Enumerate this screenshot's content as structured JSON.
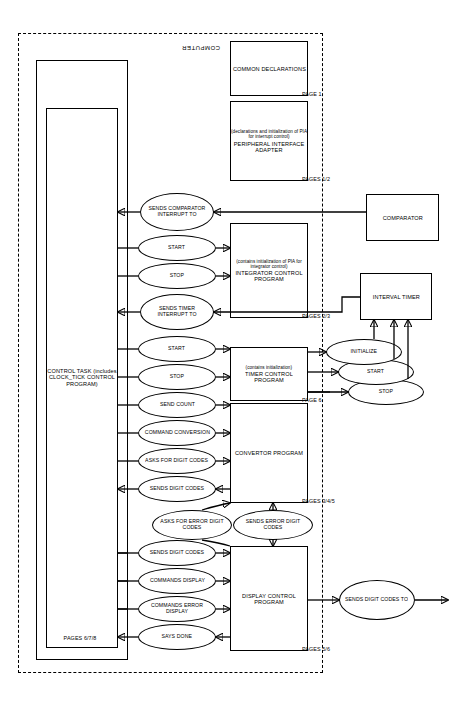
{
  "figure": {
    "orientation": "rotated-180",
    "boundary": {
      "label": "COMPUTER"
    }
  },
  "external_blocks": [
    {
      "name": "comparator",
      "label": "COMPARATOR"
    },
    {
      "name": "interval-timer",
      "label": "INTERVAL TIMER"
    }
  ],
  "control_program": {
    "outer_label": "CONTROL PROGRAM",
    "inner_label": "CONTROL TASK (includes CLOCK_TICK CONTROL PROGRAM)",
    "inner_pages": "PAGES 6/7/8"
  },
  "modules": [
    {
      "name": "display-control-program",
      "title": "DISPLAY CONTROL PROGRAM",
      "sub": "",
      "pages": "PAGES 5/6"
    },
    {
      "name": "convertor-program",
      "title": "CONVERTOR PROGRAM",
      "sub": "",
      "pages": "PAGES 3/4/5"
    },
    {
      "name": "timer-control-program",
      "title": "TIMER CONTROL PROGRAM",
      "sub": "(contains initialization)",
      "pages": "PAGE 6"
    },
    {
      "name": "integrator-control-program",
      "title": "INTEGRATOR CONTROL PROGRAM",
      "sub": "(contains initialization of PIA for integrator control)",
      "pages": "PAGES 2/3"
    },
    {
      "name": "peripheral-interface-adapter",
      "title": "PERIPHERAL INTERFACE ADAPTER",
      "sub": "(declarations and initialization of PIA for interrupt control)",
      "pages": "PAGES 1/2"
    },
    {
      "name": "common-declarations",
      "title": "COMMON DECLARATIONS",
      "sub": "",
      "pages": "PAGE 1"
    }
  ],
  "messages": [
    {
      "name": "sends-digit-codes-to",
      "label": "SENDS DIGIT CODES TO"
    },
    {
      "name": "says-done",
      "label": "SAYS DONE"
    },
    {
      "name": "commands-error-display",
      "label": "COMMANDS ERROR DISPLAY"
    },
    {
      "name": "commands-display",
      "label": "COMMANDS DISPLAY"
    },
    {
      "name": "sends-digit-codes-display",
      "label": "SENDS DIGIT CODES"
    },
    {
      "name": "sends-error-digit-codes",
      "label": "SENDS ERROR DIGIT CODES"
    },
    {
      "name": "asks-for-error-digit-codes",
      "label": "ASKS FOR ERROR DIGIT CODES"
    },
    {
      "name": "sends-digit-codes-conv",
      "label": "SENDS DIGIT CODES"
    },
    {
      "name": "asks-for-digit-codes",
      "label": "ASKS FOR DIGIT CODES"
    },
    {
      "name": "command-conversion",
      "label": "COMMAND CONVERSION"
    },
    {
      "name": "send-count",
      "label": "SEND COUNT"
    },
    {
      "name": "timer-stop",
      "label": "STOP"
    },
    {
      "name": "timer-start",
      "label": "START"
    },
    {
      "name": "sends-timer-interrupt-to",
      "label": "SENDS TIMER INTERRUPT TO"
    },
    {
      "name": "integrator-stop",
      "label": "STOP"
    },
    {
      "name": "integrator-start",
      "label": "START"
    },
    {
      "name": "sends-comparator-interrupt-to",
      "label": "SENDS COMPARATOR INTERRUPT TO"
    },
    {
      "name": "itimer-stop",
      "label": "STOP"
    },
    {
      "name": "itimer-start",
      "label": "START"
    },
    {
      "name": "itimer-initialize",
      "label": "INITIALIZE"
    }
  ]
}
